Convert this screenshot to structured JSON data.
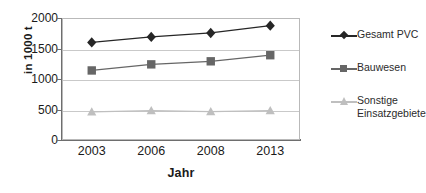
{
  "chart_data": {
    "type": "line",
    "title": "",
    "xlabel": "Jahr",
    "ylabel": "in 1000 t",
    "categories": [
      "2003",
      "2006",
      "2008",
      "2013"
    ],
    "ylim": [
      0,
      2000
    ],
    "yticks": [
      0,
      500,
      1000,
      1500,
      2000
    ],
    "ytick_labels": [
      "0",
      "500",
      "1000",
      "1500",
      "2000"
    ],
    "grid": "horizontal",
    "legend_position": "right",
    "series": [
      {
        "name": "Gesamt PVC",
        "values": [
          1600,
          1690,
          1755,
          1875
        ],
        "color": "#262626",
        "marker": "diamond"
      },
      {
        "name": "Bauwesen",
        "values": [
          1140,
          1240,
          1290,
          1390
        ],
        "color": "#666666",
        "marker": "square"
      },
      {
        "name": "Sonstige Einsatzgebiete",
        "values": [
          460,
          480,
          465,
          480
        ],
        "color": "#bfbfbf",
        "marker": "triangle"
      }
    ]
  },
  "axes": {
    "y_title": "in 1000 t",
    "x_title": "Jahr"
  },
  "legend": {
    "items": [
      {
        "label": "Gesamt PVC"
      },
      {
        "label": "Bauwesen"
      },
      {
        "label": "Sonstige Einsatzgebiete"
      }
    ]
  }
}
